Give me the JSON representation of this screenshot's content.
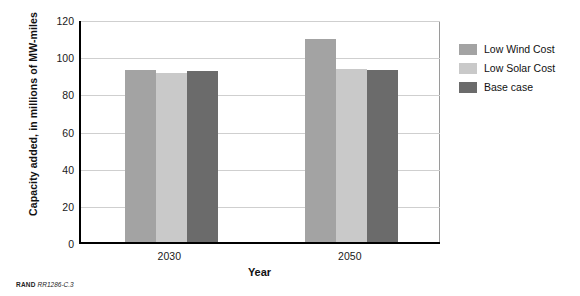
{
  "chart_data": {
    "type": "bar",
    "title": "",
    "xlabel": "Year",
    "ylabel": "Capacity added, in millions of MW-miles",
    "categories": [
      "2030",
      "2050"
    ],
    "series": [
      {
        "name": "Low Wind Cost",
        "color": "#a3a3a3",
        "values": [
          92.5,
          109
        ]
      },
      {
        "name": "Low Solar Cost",
        "color": "#c9c9c9",
        "values": [
          91,
          93
        ]
      },
      {
        "name": "Base case",
        "color": "#6b6b6b",
        "values": [
          92,
          92.5
        ]
      }
    ],
    "ylim": [
      0,
      120
    ],
    "yticks": [
      0,
      20,
      40,
      60,
      80,
      100,
      120
    ],
    "grid": true,
    "legend_position": "right"
  },
  "legend": {
    "items": [
      {
        "label": "Low Wind Cost"
      },
      {
        "label": "Low Solar Cost"
      },
      {
        "label": "Base case"
      }
    ]
  },
  "caption": {
    "org": "RAND",
    "number": "RR1286-C.3"
  }
}
